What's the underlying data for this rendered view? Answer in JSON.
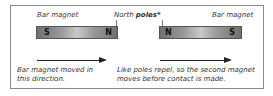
{
  "diagram": {
    "left_magnet": {
      "label": "Bar magnet",
      "left_pole": "S",
      "right_pole": "N"
    },
    "right_magnet": {
      "label": "Bar magnet",
      "left_pole": "N",
      "right_pole": "S"
    },
    "north_label_prefix": "North ",
    "north_label_bold": "poles*",
    "left_caption_line1": "Bar magnet moved in",
    "left_caption_line2": "this direction.",
    "right_caption_line1": "Like poles repel, so the second magnet",
    "right_caption_line2": "moves before contact is made."
  }
}
